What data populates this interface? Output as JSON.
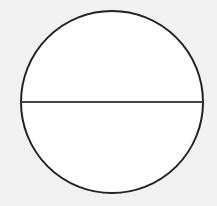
{
  "diagram": {
    "type": "circle-with-diameter",
    "background": "#f1f1f1",
    "circle": {
      "cx": 112,
      "cy": 102,
      "r": 91,
      "fill": "#ffffff",
      "stroke": "#222222",
      "stroke_width": 2
    },
    "diameter": {
      "x1": 21,
      "y1": 102,
      "x2": 203,
      "y2": 102,
      "stroke": "#444444",
      "stroke_width": 2
    }
  }
}
